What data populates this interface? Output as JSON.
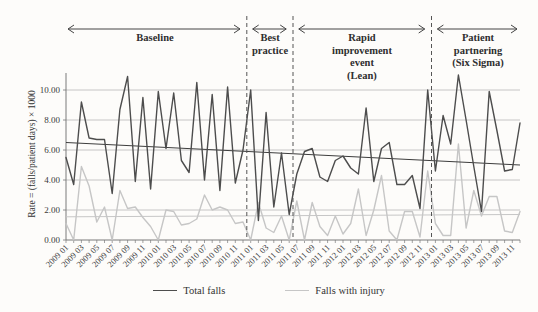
{
  "chart_data": {
    "type": "line",
    "y_axis": {
      "label": "Rate = (falls/patient days) × 1000",
      "ticks": [
        {
          "value": 0,
          "label": "0.00"
        },
        {
          "value": 2,
          "label": "2.00"
        },
        {
          "value": 4,
          "label": "4.00"
        },
        {
          "value": 6,
          "label": "6.00"
        },
        {
          "value": 8,
          "label": "8.00"
        },
        {
          "value": 10,
          "label": "10.00"
        }
      ],
      "range": [
        0,
        11.2
      ],
      "grid": true
    },
    "x_axis": {
      "unit": "year month",
      "months_start": "2009 01",
      "months_end": "2013 12",
      "tick_labels": [
        "2009 01",
        "2009 03",
        "2009 05",
        "2009 07",
        "2009 09",
        "2009 11",
        "2010 01",
        "2010 03",
        "2010 05",
        "2010 07",
        "2010 09",
        "2010 11",
        "2011 01",
        "2011 03",
        "2011 05",
        "2011 07",
        "2011 09",
        "2011 11",
        "2012 01",
        "2012 03",
        "2012 05",
        "2012 07",
        "2012 09",
        "2012 11",
        "2013 01",
        "2013 03",
        "2013 05",
        "2013 07",
        "2013 09",
        "2013 11"
      ]
    },
    "series": [
      {
        "name": "Total falls",
        "color": "#4d4d4d",
        "values": [
          5.5,
          3.7,
          9.2,
          6.8,
          6.7,
          6.7,
          3.1,
          8.7,
          10.9,
          3.9,
          9.5,
          3.4,
          9.9,
          6.1,
          9.8,
          5.3,
          4.5,
          10.5,
          4.0,
          9.7,
          3.3,
          10.2,
          3.8,
          6.0,
          10.0,
          1.3,
          8.5,
          2.2,
          5.8,
          1.7,
          4.4,
          5.9,
          6.1,
          4.2,
          3.9,
          5.3,
          5.6,
          4.8,
          4.4,
          8.8,
          3.9,
          6.1,
          6.5,
          3.7,
          3.7,
          4.3,
          2.1,
          10.0,
          4.6,
          8.3,
          6.4,
          11.0,
          8.0,
          4.9,
          1.9,
          9.9,
          7.3,
          4.6,
          4.7,
          7.8
        ]
      },
      {
        "name": "Falls with injury",
        "color": "#c6c6c6",
        "values": [
          1.1,
          0.0,
          4.9,
          3.6,
          1.2,
          2.2,
          0.0,
          3.3,
          2.1,
          2.2,
          1.5,
          0.9,
          0.0,
          2.0,
          1.9,
          1.0,
          1.1,
          1.4,
          3.0,
          2.0,
          2.2,
          2.0,
          1.1,
          1.2,
          0.0,
          2.5,
          0.8,
          0.5,
          1.6,
          0.0,
          2.6,
          0.0,
          2.5,
          0.9,
          0.3,
          1.6,
          0.4,
          1.1,
          3.4,
          0.3,
          2.0,
          4.3,
          0.6,
          0.0,
          1.9,
          1.9,
          0.2,
          4.6,
          1.1,
          0.3,
          0.3,
          6.4,
          0.8,
          3.3,
          1.6,
          2.9,
          2.9,
          0.6,
          0.5,
          1.9
        ]
      }
    ],
    "trend_lines": [
      {
        "series": "Total falls",
        "start": 6.5,
        "end": 5.0,
        "color": "#3d3d3d"
      },
      {
        "series": "Falls with injury",
        "start": 1.55,
        "end": 1.7,
        "color": "#c6c6c6"
      }
    ],
    "phases": [
      {
        "label": "Baseline",
        "start_month": 0,
        "end_month": 23
      },
      {
        "label": "Best\npractice",
        "start_month": 24,
        "end_month": 29
      },
      {
        "label": "Rapid\nimprovement\nevent\n(Lean)",
        "start_month": 30,
        "end_month": 47
      },
      {
        "label": "Patient\npartnering\n(Six Sigma)",
        "start_month": 48,
        "end_month": 59
      }
    ],
    "phase_separators_month": [
      23.5,
      29.5,
      47.5
    ],
    "legend": {
      "position": "bottom",
      "items": [
        "Total falls",
        "Falls with injury"
      ]
    }
  }
}
